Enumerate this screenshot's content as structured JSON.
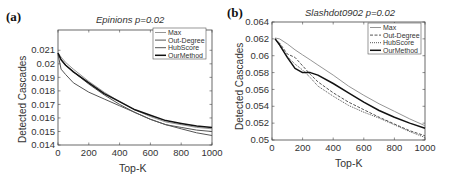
{
  "chart_data": [
    {
      "type": "line",
      "panel_label": "(a)",
      "title": "Epinions p=0.02",
      "xlabel": "Top-K",
      "ylabel": "Detected Cascades",
      "xlim": [
        0,
        1000
      ],
      "ylim": [
        0.014,
        0.0225
      ],
      "xticks": [
        0,
        200,
        400,
        600,
        800,
        1000
      ],
      "yticks": [
        0.014,
        0.015,
        0.016,
        0.017,
        0.018,
        0.019,
        0.02,
        0.021
      ],
      "ytick_labels": [
        "0.014",
        "0.015",
        "0.016",
        "0.017",
        "0.018",
        "0.019",
        "0.02",
        "0.021"
      ],
      "grid": false,
      "legend_position": "upper right",
      "x": [
        0,
        20,
        50,
        100,
        200,
        300,
        400,
        500,
        600,
        700,
        800,
        900,
        1000
      ],
      "series": [
        {
          "name": "Max",
          "style": "thin-gray",
          "values": [
            0.0208,
            0.0205,
            0.0201,
            0.0196,
            0.0187,
            0.0179,
            0.0172,
            0.0166,
            0.0161,
            0.0157,
            0.0155,
            0.0153,
            0.0152
          ]
        },
        {
          "name": "Out-Degree",
          "style": "medium-dark",
          "values": [
            0.0208,
            0.0203,
            0.0199,
            0.0194,
            0.0185,
            0.0177,
            0.017,
            0.0164,
            0.0159,
            0.0155,
            0.0153,
            0.0151,
            0.015
          ]
        },
        {
          "name": "HubScore",
          "style": "medium-dark",
          "values": [
            0.0207,
            0.0196,
            0.0192,
            0.0186,
            0.0179,
            0.0174,
            0.0169,
            0.0164,
            0.0159,
            0.0155,
            0.0152,
            0.0149,
            0.0147
          ]
        },
        {
          "name": "OurMethod",
          "style": "thick-black",
          "values": [
            0.0208,
            0.0203,
            0.0199,
            0.0194,
            0.0186,
            0.0178,
            0.0172,
            0.0166,
            0.0162,
            0.0158,
            0.0156,
            0.0154,
            0.0153
          ]
        }
      ]
    },
    {
      "type": "line",
      "panel_label": "(b)",
      "title": "Slashdot0902 p=0.02",
      "xlabel": "Top-K",
      "ylabel": "Detected Cascades",
      "xlim": [
        0,
        1000
      ],
      "ylim": [
        0.05,
        0.064
      ],
      "xticks": [
        0,
        200,
        400,
        600,
        800,
        1000
      ],
      "yticks": [
        0.05,
        0.052,
        0.054,
        0.056,
        0.058,
        0.06,
        0.062,
        0.064
      ],
      "ytick_labels": [
        "0.05",
        "0.052",
        "0.054",
        "0.056",
        "0.058",
        "0.06",
        "0.062",
        "0.064"
      ],
      "grid": false,
      "legend_position": "upper right",
      "x": [
        20,
        50,
        100,
        150,
        200,
        250,
        300,
        400,
        500,
        600,
        700,
        800,
        900,
        1000
      ],
      "series": [
        {
          "name": "Max",
          "style": "thin-gray",
          "values": [
            0.0621,
            0.062,
            0.0614,
            0.0607,
            0.0601,
            0.0595,
            0.0589,
            0.0577,
            0.0564,
            0.0553,
            0.0543,
            0.0534,
            0.0525,
            0.0517
          ]
        },
        {
          "name": "Out-Degree",
          "style": "dashed-dark",
          "values": [
            0.062,
            0.0615,
            0.0602,
            0.0598,
            0.0588,
            0.0578,
            0.0569,
            0.0556,
            0.0545,
            0.0536,
            0.0527,
            0.0519,
            0.0511,
            0.0505
          ]
        },
        {
          "name": "HubScore",
          "style": "dotted-dark",
          "values": [
            0.062,
            0.0612,
            0.0599,
            0.059,
            0.0583,
            0.0574,
            0.0564,
            0.0552,
            0.0541,
            0.0533,
            0.0526,
            0.0518,
            0.051,
            0.0503
          ]
        },
        {
          "name": "OurMethod",
          "style": "thick-black",
          "values": [
            0.062,
            0.0613,
            0.0598,
            0.0585,
            0.058,
            0.058,
            0.0577,
            0.0567,
            0.0556,
            0.0545,
            0.0535,
            0.0527,
            0.052,
            0.0514
          ]
        }
      ]
    }
  ]
}
